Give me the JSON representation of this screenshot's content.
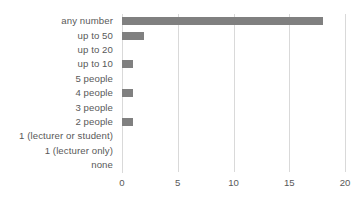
{
  "chart_data": {
    "type": "bar",
    "orientation": "horizontal",
    "title": "",
    "subtitle": "",
    "xlabel": "",
    "ylabel": "",
    "categories": [
      "any number",
      "up to 50",
      "up to 20",
      "up to 10",
      "5 people",
      "4 people",
      "3 people",
      "2 people",
      "1 (lecturer or student)",
      "1 (lecturer only)",
      "none"
    ],
    "values": [
      18,
      2,
      0,
      1,
      0,
      1,
      0,
      1,
      0,
      0,
      0
    ],
    "xlim": [
      0,
      20
    ],
    "xticks": [
      0,
      5,
      10,
      15,
      20
    ],
    "xtick_labels": [
      "0",
      "5",
      "10",
      "15",
      "20"
    ],
    "grid": true,
    "legend": false,
    "legend_position": "none",
    "series": [
      {
        "name": "",
        "values": [
          18,
          2,
          0,
          1,
          0,
          1,
          0,
          1,
          0,
          0,
          0
        ],
        "color": "#808080"
      }
    ],
    "colors": {
      "bar": "#808080",
      "gridline": "#d9d9d9",
      "axis": "#d9d9d9",
      "tick_text": "#595959",
      "background": "#ffffff"
    }
  }
}
